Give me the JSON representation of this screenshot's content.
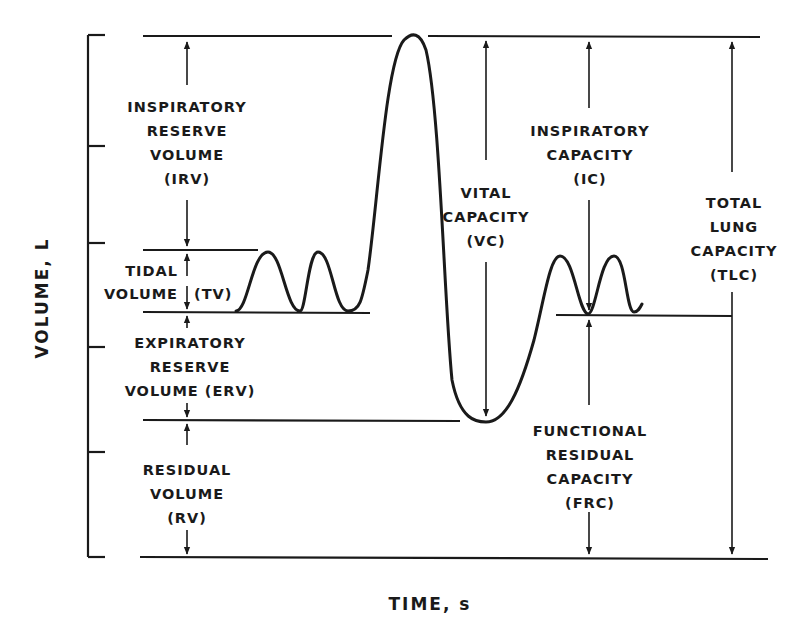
{
  "diagram": {
    "y_axis_label": "VOLUME, L",
    "x_axis_label": "TIME, s",
    "colors": {
      "ink": "#1a1a1a",
      "background": "#ffffff"
    },
    "volumes": {
      "irv": {
        "lines": [
          "INSPIRATORY",
          "RESERVE",
          "VOLUME",
          "(IRV)"
        ]
      },
      "tv": {
        "lines": [
          "TIDAL",
          "VOLUME"
        ],
        "abbr": "(TV)"
      },
      "erv": {
        "lines": [
          "EXPIRATORY",
          "RESERVE",
          "VOLUME (ERV)"
        ]
      },
      "rv": {
        "lines": [
          "RESIDUAL",
          "VOLUME",
          "(RV)"
        ]
      }
    },
    "capacities": {
      "vc": {
        "lines": [
          "VITAL",
          "CAPACITY",
          "(VC)"
        ]
      },
      "ic": {
        "lines": [
          "INSPIRATORY",
          "CAPACITY",
          "(IC)"
        ]
      },
      "tlc": {
        "lines": [
          "TOTAL",
          "LUNG",
          "CAPACITY",
          "(TLC)"
        ]
      },
      "frc": {
        "lines": [
          "FUNCTIONAL",
          "RESIDUAL",
          "CAPACITY",
          "(FRC)"
        ]
      }
    },
    "axis_ticks_count": 6
  }
}
